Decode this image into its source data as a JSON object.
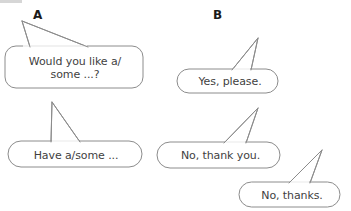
{
  "page": {
    "background_color": "#ffffff",
    "bubble_outline_color": "#8c8c8c",
    "bubble_fill_color": "#ffffff",
    "text_color": "#3f3f3f",
    "label_color": "#1a1a1a"
  },
  "columns": [
    {
      "id": "a",
      "label": "A"
    },
    {
      "id": "b",
      "label": "B"
    }
  ],
  "bubbles": [
    {
      "id": "bubble-1",
      "column": "A",
      "text": "Would you like a/\nsome ...?",
      "tail": "up-left"
    },
    {
      "id": "bubble-2",
      "column": "A",
      "text": "Have a/some ...",
      "tail": "up-left"
    },
    {
      "id": "bubble-3",
      "column": "B",
      "text": "Yes, please.",
      "tail": "up-right"
    },
    {
      "id": "bubble-4",
      "column": "B",
      "text": "No, thank you.",
      "tail": "up-right"
    },
    {
      "id": "bubble-5",
      "column": "B",
      "text": "No, thanks.",
      "tail": "up-right"
    }
  ]
}
